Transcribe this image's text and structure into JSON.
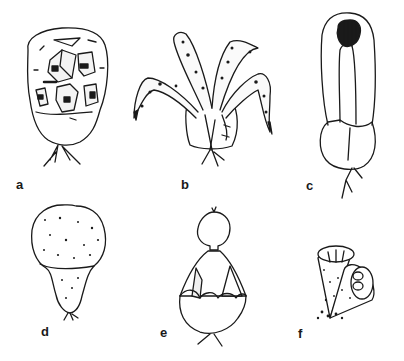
{
  "figure": {
    "panels": [
      {
        "label": "a",
        "description": "Rounded capsule with cracked surface revealing interior compartments, stalk roots below"
      },
      {
        "label": "b",
        "description": "Cup-shaped base with several curved, spotted arms radiating upward"
      },
      {
        "label": "c",
        "description": "Tall elongated loop structure with striped dark opening at top, bulbous base and roots"
      },
      {
        "label": "d",
        "description": "Smooth stippled bulb with short tapered stalk and small roots"
      },
      {
        "label": "e",
        "description": "Base cup with scalloped rim, tent-like opening with flaps and rounded knob on top"
      },
      {
        "label": "f",
        "description": "Two conical cups with ribbed open ends and stippled surface, tufted base"
      }
    ]
  },
  "colors": {
    "ink": "#1a1a1a",
    "background": "#ffffff"
  }
}
